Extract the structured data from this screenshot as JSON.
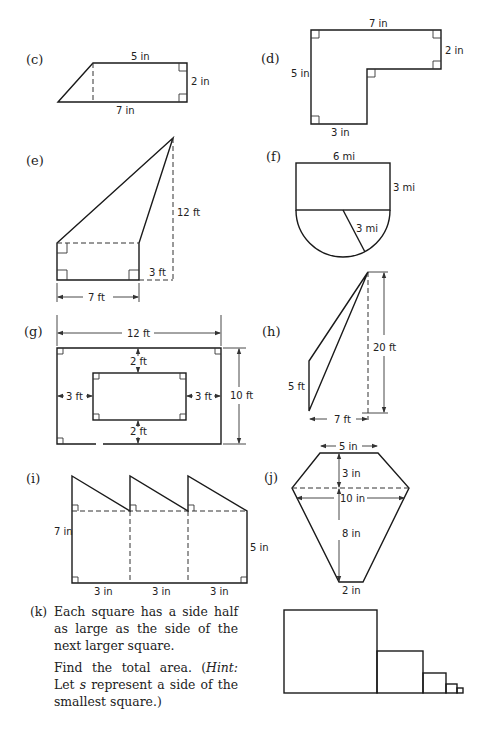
{
  "figures": {
    "c": {
      "tag": "(c)",
      "top": "5 in",
      "right": "2 in",
      "bottom": "7 in"
    },
    "d": {
      "tag": "(d)",
      "top": "7 in",
      "right": "2 in",
      "left": "5 in",
      "bottom": "3 in"
    },
    "e": {
      "tag": "(e)",
      "height": "12 ft",
      "offset": "3 ft",
      "width": "7 ft"
    },
    "f": {
      "tag": "(f)",
      "top": "6 mi",
      "right": "3 mi",
      "radius": "3 mi"
    },
    "g": {
      "tag": "(g)",
      "outer_width": "12 ft",
      "outer_height": "10 ft",
      "top_gap": "2 ft",
      "bottom_gap": "2 ft",
      "left_gap": "3 ft",
      "right_gap": "3 ft"
    },
    "h": {
      "tag": "(h)",
      "height": "20 ft",
      "side": "5 ft",
      "base": "7 ft"
    },
    "i": {
      "tag": "(i)",
      "left": "7 in",
      "right": "5 in",
      "segments": [
        "3 in",
        "3 in",
        "3 in"
      ]
    },
    "j": {
      "tag": "(j)",
      "top": "5 in",
      "upper_height": "3 in",
      "middle": "10 in",
      "lower_height": "8 in",
      "bottom": "2 in"
    }
  },
  "problem_k": {
    "tag": "(k)",
    "paragraph1": "Each square has a side half as large as the side of the next larger square.",
    "paragraph2_prefix": "Find the total area. (",
    "paragraph2_hint": "Hint:",
    "paragraph2_mid": " Let ",
    "paragraph2_var": "s",
    "paragraph2_suffix": " represent a side of the smallest square.)"
  }
}
